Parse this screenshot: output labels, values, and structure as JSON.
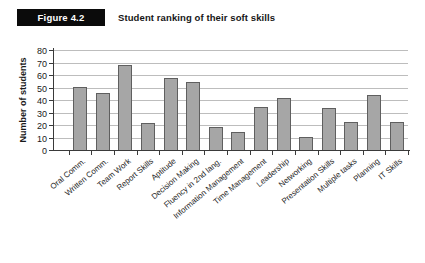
{
  "header": {
    "figure_label": "Figure 4.2",
    "title": "Student ranking of their soft skills"
  },
  "chart_data": {
    "type": "bar",
    "title": "Student ranking of their soft skills",
    "categories": [
      "Oral Comm.",
      "Written Comm.",
      "Team Work",
      "Report Skills",
      "Aptitude",
      "Decision Making",
      "Fluency in 2nd lang.",
      "Information Management",
      "Time Management",
      "Leadership",
      "Networking",
      "Presentation Skills",
      "Multiple tasks",
      "Planning",
      "IT Skills"
    ],
    "values": [
      50,
      45,
      68,
      21,
      57,
      54,
      18,
      14,
      34,
      41,
      10,
      33,
      22,
      44,
      22
    ],
    "xlabel": "",
    "ylabel": "Number of students",
    "ylim": [
      0,
      80
    ],
    "yticks": [
      0,
      10,
      20,
      30,
      40,
      50,
      60,
      70,
      80
    ],
    "grid": true,
    "legend": "none",
    "colors": {
      "bar_fill": "#a6a6a6",
      "bar_border": "#5f5f5f",
      "gridline": "#bdbdbd",
      "axis": "#3a3a3a",
      "tick_text": "#1a1a1a",
      "label_text": "#1f1f1f"
    }
  }
}
